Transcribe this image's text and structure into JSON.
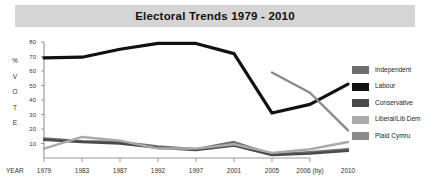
{
  "title": "Electoral Trends 1979 - 2010",
  "axis": {
    "y_axis_label_chars": [
      "%",
      "V",
      "O",
      "T",
      "E"
    ],
    "x_axis_label": "YEAR",
    "y_ticks": [
      "10",
      "20",
      "30",
      "40",
      "50",
      "60",
      "70",
      "80"
    ],
    "x_ticks": [
      "1979",
      "1983",
      "1987",
      "1992",
      "1997",
      "2001",
      "2005",
      "2006 (by)",
      "2010"
    ]
  },
  "legend": {
    "items": [
      {
        "label": "Independent",
        "color": "#6e6e6e"
      },
      {
        "label": "Labour",
        "color": "#111111"
      },
      {
        "label": "Conservative",
        "color": "#4a4a4a"
      },
      {
        "label": "Liberal/Lib Dem",
        "color": "#aaaaaa"
      },
      {
        "label": "Plaid Cymru",
        "color": "#8a8a8a"
      }
    ]
  },
  "colors": {
    "title_band": "#d5d5d5",
    "axis": "#9a9a9a",
    "plot_background": "#ffffff"
  },
  "chart_data": {
    "type": "line",
    "title": "Electoral Trends 1979 - 2010",
    "xlabel": "YEAR",
    "ylabel": "% VOTE",
    "categories": [
      "1979",
      "1983",
      "1987",
      "1992",
      "1997",
      "2001",
      "2005",
      "2006 (by)",
      "2010"
    ],
    "ylim": [
      0,
      80
    ],
    "xlim": [
      0,
      8
    ],
    "grid": false,
    "legend_position": "right",
    "series": [
      {
        "name": "Independent",
        "color": "#6e6e6e",
        "values": [
          13.5,
          11.5,
          11.0,
          8.0,
          6.0,
          11.0,
          2.5,
          4.0,
          6.0
        ]
      },
      {
        "name": "Labour",
        "color": "#111111",
        "values": [
          69.0,
          69.5,
          75.0,
          79.0,
          79.0,
          72.0,
          31.0,
          37.0,
          51.0
        ]
      },
      {
        "name": "Conservative",
        "color": "#4a4a4a",
        "values": [
          12.5,
          11.0,
          10.0,
          7.0,
          5.5,
          8.5,
          2.0,
          3.0,
          5.0
        ]
      },
      {
        "name": "Liberal/Lib Dem",
        "color": "#aaaaaa",
        "values": [
          6.5,
          14.5,
          12.0,
          6.5,
          6.5,
          9.5,
          3.5,
          6.0,
          11.0
        ]
      },
      {
        "name": "Plaid Cymru",
        "color": "#8a8a8a",
        "values": [
          null,
          null,
          null,
          null,
          null,
          null,
          59.0,
          45.0,
          19.0
        ]
      }
    ]
  }
}
